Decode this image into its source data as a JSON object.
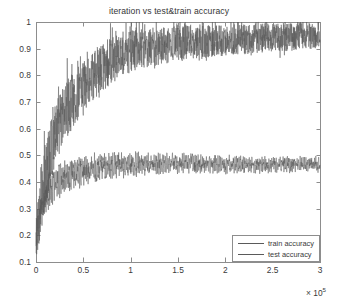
{
  "chart_data": {
    "type": "line",
    "title": "iteration vs test&train accuracy",
    "xlabel": "",
    "ylabel": "",
    "x_exponent_prefix": "× 10",
    "x_exponent_power": "5",
    "x_multiplier": 100000,
    "xlim": [
      0,
      300000
    ],
    "ylim": [
      0.1,
      1.0
    ],
    "grid": false,
    "xticks": [
      0,
      0.5,
      1,
      1.5,
      2,
      2.5,
      3
    ],
    "xtick_labels": [
      "0",
      "0.5",
      "1",
      "1.5",
      "2",
      "2.5",
      "3"
    ],
    "yticks": [
      0.1,
      0.2,
      0.3,
      0.4,
      0.5,
      0.6,
      0.7,
      0.8,
      0.9,
      1
    ],
    "ytick_labels": [
      "0.1",
      "0.2",
      "0.3",
      "0.4",
      "0.5",
      "0.6",
      "0.7",
      "0.8",
      "0.9",
      "1"
    ],
    "legend_position": "lower right",
    "series": [
      {
        "name": "train accuracy",
        "color": "#5a5a5a",
        "noise_band": 0.13,
        "noise_seed": 17,
        "description": "Rises steeply from ~0.20 to ~0.90 by x=1e5, saturating near 1.0; very noisy dense band with spikes reaching 1.0 and dips to ~0.72.",
        "x": [
          0,
          5000,
          10000,
          15000,
          20000,
          25000,
          30000,
          40000,
          50000,
          60000,
          70000,
          80000,
          90000,
          100000,
          120000,
          140000,
          160000,
          180000,
          200000,
          220000,
          240000,
          260000,
          280000,
          300000
        ],
        "values": [
          0.2,
          0.33,
          0.42,
          0.5,
          0.57,
          0.62,
          0.66,
          0.71,
          0.76,
          0.8,
          0.83,
          0.855,
          0.875,
          0.89,
          0.905,
          0.915,
          0.922,
          0.928,
          0.932,
          0.936,
          0.94,
          0.943,
          0.946,
          0.95
        ]
      },
      {
        "name": "test accuracy",
        "color": "#5a5a5a",
        "noise_band": 0.045,
        "noise_seed": 93,
        "description": "Rises quickly from ~0.18 to a plateau around 0.46-0.47 by x=0.8e5, then oscillates in a regular saw-tooth band between ~0.43 and ~0.50 for the remainder.",
        "x": [
          0,
          5000,
          10000,
          15000,
          20000,
          25000,
          30000,
          40000,
          50000,
          60000,
          70000,
          80000,
          100000,
          120000,
          140000,
          160000,
          180000,
          200000,
          220000,
          240000,
          260000,
          280000,
          300000
        ],
        "values": [
          0.18,
          0.29,
          0.34,
          0.375,
          0.395,
          0.41,
          0.42,
          0.435,
          0.443,
          0.45,
          0.457,
          0.462,
          0.466,
          0.468,
          0.47,
          0.471,
          0.468,
          0.466,
          0.464,
          0.465,
          0.467,
          0.466,
          0.465
        ]
      }
    ]
  },
  "legend": {
    "items": [
      {
        "label": "train accuracy"
      },
      {
        "label": "test accuracy"
      }
    ]
  },
  "axes": {
    "plot_left": 36,
    "plot_top": 22,
    "plot_right": 320,
    "plot_bottom": 262,
    "axis_color": "#8d8d8d"
  }
}
